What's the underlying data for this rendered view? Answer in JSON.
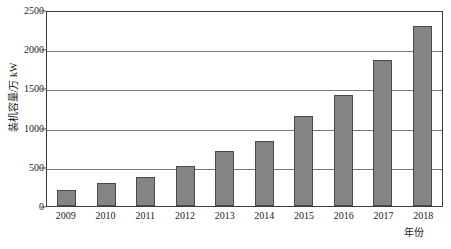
{
  "chart_data": {
    "type": "bar",
    "title": "",
    "subtitle": "",
    "xlabel": "年份",
    "ylabel": "装机容量/万 kW",
    "categories": [
      "2009",
      "2010",
      "2011",
      "2012",
      "2013",
      "2014",
      "2015",
      "2016",
      "2017",
      "2018"
    ],
    "values": [
      200,
      290,
      370,
      510,
      700,
      830,
      1150,
      1420,
      1860,
      2300
    ],
    "series": [
      {
        "name": "装机容量",
        "values": [
          200,
          290,
          370,
          510,
          700,
          830,
          1150,
          1420,
          1860,
          2300
        ]
      }
    ],
    "ylim": [
      0,
      2500
    ],
    "ytick_values": [
      0,
      500,
      1000,
      1500,
      2000,
      2500
    ],
    "ytick_labels": [
      "0",
      "500",
      "1000",
      "1500",
      "2000",
      "2500"
    ],
    "grid": "horizontal",
    "legend": "none",
    "bar_color": "#848484",
    "bar_border_color": "#4a4a4a",
    "gridline_color": "#777777",
    "axis_color": "#3c3c3c",
    "background_color": "#ffffff"
  }
}
